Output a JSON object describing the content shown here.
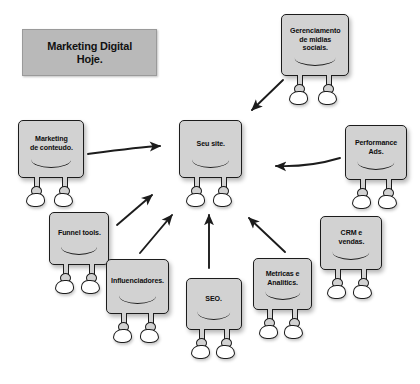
{
  "title": {
    "line1": "Marketing Digital",
    "line2": "Hoje.",
    "full": "Marketing Digital Hoje.",
    "background_color": "#b9b9b9"
  },
  "palette": {
    "page_background": "#ffffff",
    "node_fill": "#d2d2d2",
    "node_stroke": "#1c1c1c",
    "shoe_fill": "#ffffff",
    "arrow_color": "#1c1c1c",
    "text_color": "#0d0d0d"
  },
  "diagram": {
    "type": "hub-and-spoke",
    "hub": "seu-site",
    "nodes": [
      {
        "id": "gerenciamento-midias-sociais",
        "label": "Gerenciamento de midias sociais.",
        "lines": [
          "Gerenciamento",
          "de midias",
          "sociais."
        ],
        "x": 281,
        "y": 14,
        "w": 68,
        "h": 62
      },
      {
        "id": "marketing-conteudo",
        "label": "Marketing de conteudo.",
        "lines": [
          "Marketing",
          "de conteudo."
        ],
        "x": 18,
        "y": 120,
        "w": 66,
        "h": 58
      },
      {
        "id": "seu-site",
        "label": "Seu site.",
        "lines": [
          "Seu site."
        ],
        "x": 179,
        "y": 120,
        "w": 63,
        "h": 58
      },
      {
        "id": "performance-ads",
        "label": "Performance Ads.",
        "lines": [
          "Performance",
          "Ads."
        ],
        "x": 345,
        "y": 125,
        "w": 62,
        "h": 55
      },
      {
        "id": "funnel-tools",
        "label": "Funnel tools.",
        "lines": [
          "Funnel tools."
        ],
        "x": 49,
        "y": 212,
        "w": 60,
        "h": 53
      },
      {
        "id": "crm-vendas",
        "label": "CRM e vendas.",
        "lines": [
          "CRM e",
          "vendas."
        ],
        "x": 320,
        "y": 216,
        "w": 62,
        "h": 54
      },
      {
        "id": "influenciadores",
        "label": "Influenciadores.",
        "lines": [
          "Influenciadores."
        ],
        "x": 106,
        "y": 259,
        "w": 63,
        "h": 55
      },
      {
        "id": "metricas-analitics",
        "label": "Metricas e Analitics.",
        "lines": [
          "Metricas e",
          "Analitics."
        ],
        "x": 253,
        "y": 258,
        "w": 59,
        "h": 52
      },
      {
        "id": "seo",
        "label": "SEO.",
        "lines": [
          "SEO."
        ],
        "x": 186,
        "y": 278,
        "w": 56,
        "h": 52
      }
    ],
    "arrows": [
      {
        "id": "arrow-marketing-conteudo-to-seu-site",
        "from": "marketing-conteudo",
        "to": "seu-site",
        "direction": "right"
      },
      {
        "id": "arrow-midias-sociais-to-seu-site",
        "from": "gerenciamento-midias-sociais",
        "to": "seu-site",
        "direction": "down-left"
      },
      {
        "id": "arrow-performance-ads-to-seu-site",
        "from": "performance-ads",
        "to": "seu-site",
        "direction": "left"
      },
      {
        "id": "arrow-funnel-tools-to-seu-site",
        "from": "funnel-tools",
        "to": "seu-site",
        "direction": "up-right"
      },
      {
        "id": "arrow-influenciadores-to-seu-site",
        "from": "influenciadores",
        "to": "seu-site",
        "direction": "up-right"
      },
      {
        "id": "arrow-seo-to-seu-site",
        "from": "seo",
        "to": "seu-site",
        "direction": "up"
      },
      {
        "id": "arrow-metricas-to-seu-site",
        "from": "metricas-analitics",
        "to": "seu-site",
        "direction": "up-left"
      }
    ]
  }
}
